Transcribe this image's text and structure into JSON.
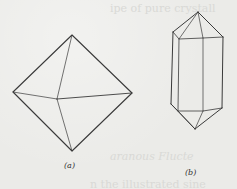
{
  "figure": {
    "panels": [
      {
        "id": "a",
        "label": "(a)",
        "shape": "octahedron",
        "vertices": {
          "top": [
            72,
            35
          ],
          "left": [
            13,
            92
          ],
          "center": [
            57,
            99
          ],
          "right": [
            132,
            93
          ],
          "bottom": [
            72,
            151
          ]
        }
      },
      {
        "id": "b",
        "label": "(b)",
        "shape": "hexagonal prism with pyramidal terminations",
        "vertices": {
          "apex_top": [
            198,
            12
          ],
          "upper_far_left": [
            173,
            32
          ],
          "upper_left_front": [
            179,
            39
          ],
          "upper_right_front": [
            203,
            38
          ],
          "upper_far_right": [
            223,
            37
          ],
          "lower_far_left": [
            171,
            104
          ],
          "lower_left_front": [
            178,
            111
          ],
          "lower_mid": [
            203,
            111
          ],
          "lower_right": [
            222,
            108
          ],
          "apex_bottom": [
            195,
            129
          ]
        }
      }
    ],
    "line_color": "#3a3a3a",
    "background_color": "#ebebe8"
  },
  "bleed_text": {
    "top": "ipe of pure crystall",
    "mid": "aranous Flucte",
    "bottom": "n the illustrated sine"
  }
}
